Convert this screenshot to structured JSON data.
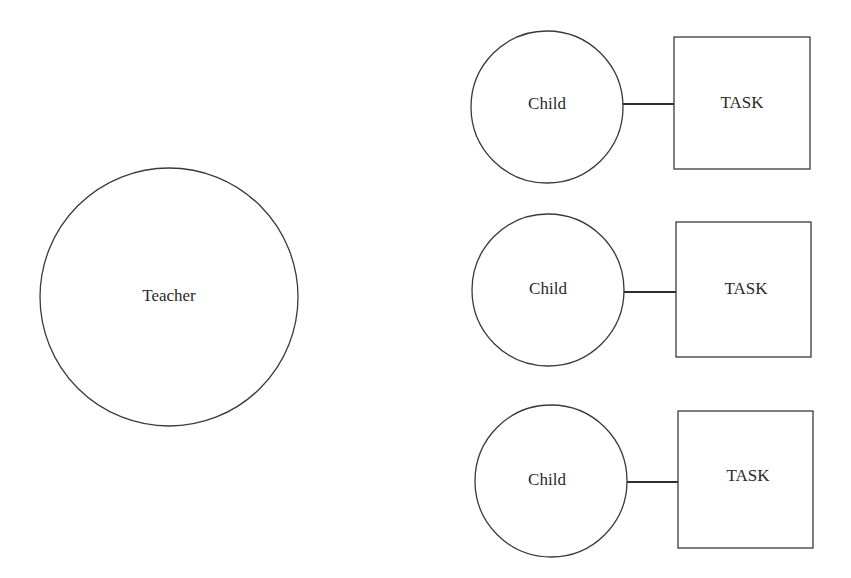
{
  "diagram": {
    "type": "relationship-diagram",
    "teacher": {
      "label": "Teacher",
      "cx": 169,
      "cy": 297,
      "r": 129
    },
    "pairs": [
      {
        "child": {
          "label": "Child",
          "cx": 547,
          "cy": 107,
          "r": 76
        },
        "task": {
          "label": "TASK",
          "x": 674,
          "y": 37,
          "w": 136,
          "h": 132
        },
        "link": {
          "x1": 623,
          "y1": 104,
          "x2": 674,
          "y2": 104
        }
      },
      {
        "child": {
          "label": "Child",
          "cx": 548,
          "cy": 290,
          "r": 76
        },
        "task": {
          "label": "TASK",
          "x": 676,
          "y": 222,
          "w": 135,
          "h": 135
        },
        "link": {
          "x1": 624,
          "y1": 292,
          "x2": 676,
          "y2": 292
        }
      },
      {
        "child": {
          "label": "Child",
          "cx": 551,
          "cy": 481,
          "r": 76
        },
        "task": {
          "label": "TASK",
          "x": 678,
          "y": 411,
          "w": 135,
          "h": 137
        },
        "link": {
          "x1": 627,
          "y1": 482,
          "x2": 678,
          "y2": 482
        }
      }
    ],
    "colors": {
      "stroke": "#3a3a3a",
      "text": "#2a2a2a",
      "background": "#ffffff"
    }
  }
}
